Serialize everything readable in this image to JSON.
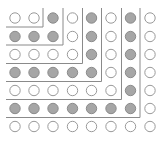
{
  "diagram": {
    "grid": {
      "cols": 8,
      "rows": 7,
      "col_x": [
        15,
        34,
        53,
        72.5,
        91.5,
        111,
        130.5,
        150
      ],
      "row_y": [
        18,
        36.5,
        54.5,
        72.5,
        90.5,
        108.5,
        126.5
      ],
      "radius": 5.2
    },
    "pattern": [
      [
        0,
        0,
        1,
        0,
        1,
        0,
        1,
        0
      ],
      [
        1,
        1,
        1,
        0,
        1,
        0,
        1,
        0
      ],
      [
        0,
        0,
        0,
        0,
        1,
        0,
        1,
        0
      ],
      [
        1,
        1,
        1,
        1,
        1,
        0,
        1,
        0
      ],
      [
        0,
        0,
        0,
        0,
        0,
        0,
        1,
        0
      ],
      [
        1,
        1,
        1,
        1,
        1,
        1,
        1,
        0
      ],
      [
        0,
        0,
        0,
        0,
        0,
        0,
        0,
        0
      ]
    ],
    "l_shapes": [
      {
        "vx": 43,
        "hy": 27
      },
      {
        "vx": 63,
        "hy": 45
      },
      {
        "vx": 82.5,
        "hy": 63.5
      },
      {
        "vx": 101.5,
        "hy": 81.5
      },
      {
        "vx": 121.5,
        "hy": 99.5
      },
      {
        "vx": 140,
        "hy": 117.5
      }
    ],
    "line_origin": {
      "x": 6,
      "y": 8
    },
    "colors": {
      "filled": "#a6a6a6",
      "filled_stroke": "#8c8c8c",
      "empty_fill": "#ffffff",
      "empty_stroke": "#9a9a9a",
      "line": "#8a8a8a"
    }
  }
}
